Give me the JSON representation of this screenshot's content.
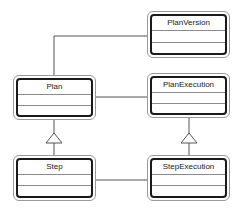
{
  "diagram": {
    "type": "uml-class-diagram",
    "classes": [
      {
        "id": "planversion",
        "name": "PlanVersion"
      },
      {
        "id": "plan",
        "name": "Plan"
      },
      {
        "id": "planexecution",
        "name": "PlanExecution"
      },
      {
        "id": "step",
        "name": "Step"
      },
      {
        "id": "stepexecution",
        "name": "StepExecution"
      }
    ],
    "relationships": [
      {
        "from": "Plan",
        "to": "PlanVersion",
        "kind": "association"
      },
      {
        "from": "Plan",
        "to": "PlanExecution",
        "kind": "association"
      },
      {
        "from": "Step",
        "to": "StepExecution",
        "kind": "association"
      },
      {
        "from": "Step",
        "to": "Plan",
        "kind": "generalization"
      },
      {
        "from": "StepExecution",
        "to": "PlanExecution",
        "kind": "generalization"
      }
    ],
    "colors": {
      "line": "#555555",
      "box_border": "#1a1a1a"
    }
  }
}
